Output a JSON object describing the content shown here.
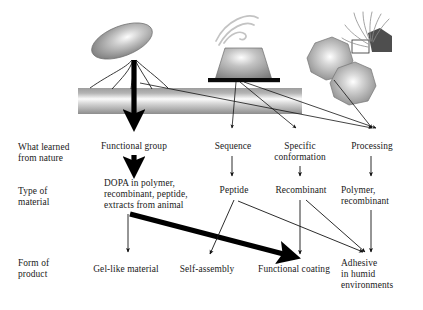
{
  "diagram": {
    "row_labels": [
      {
        "id": "what-learned",
        "text": "What learned\nfrom nature",
        "x": 18,
        "y": 142
      },
      {
        "id": "type-of-material",
        "text": "Type of\nmaterial",
        "x": 18,
        "y": 186
      },
      {
        "id": "form-of-product",
        "text": "Form of\nproduct",
        "x": 18,
        "y": 258
      }
    ],
    "organisms": [
      {
        "id": "mussel",
        "name": "mussel-on-substrate-illustration"
      },
      {
        "id": "barnacle",
        "name": "barnacle-on-substrate-illustration"
      },
      {
        "id": "sandcastle-worm",
        "name": "sandcastle-worm-tube-illustration"
      }
    ],
    "row1": [
      {
        "id": "functional-group",
        "text": "Functional group",
        "x": 124,
        "y": 141,
        "w": 90
      },
      {
        "id": "sequence",
        "text": "Sequence",
        "x": 222,
        "y": 141,
        "w": 56
      },
      {
        "id": "specific-conformation",
        "text": "Specific\nconformation",
        "x": 278,
        "y": 141,
        "w": 66
      },
      {
        "id": "processing",
        "text": "Processing",
        "x": 348,
        "y": 141,
        "w": 60
      }
    ],
    "row2": [
      {
        "id": "dopa-materials",
        "text": "DOPA in polymer,\nrecombinant, peptide,\nextracts from animal",
        "x": 106,
        "y": 179,
        "w": 118
      },
      {
        "id": "peptide",
        "text": "Peptide",
        "x": 224,
        "y": 185,
        "w": 46
      },
      {
        "id": "recombinant",
        "text": "Recombinant",
        "x": 276,
        "y": 185,
        "w": 72
      },
      {
        "id": "polymer-recombinant",
        "text": "Polymer,\nrecombinant",
        "x": 350,
        "y": 185,
        "w": 66
      }
    ],
    "row3": [
      {
        "id": "gel-like-material",
        "text": "Gel-like material",
        "x": 84,
        "y": 265,
        "w": 86
      },
      {
        "id": "self-assembly",
        "text": "Self-assembly",
        "x": 172,
        "y": 265,
        "w": 74
      },
      {
        "id": "functional-coating",
        "text": "Functional coating",
        "x": 250,
        "y": 265,
        "w": 96
      },
      {
        "id": "adhesive-humid",
        "text": "Adhesive\nin humid\nenvironments",
        "x": 350,
        "y": 259,
        "w": 70
      }
    ],
    "colors": {
      "arrow_thick": "#000000",
      "arrow_thin": "#1c1c1c",
      "text": "#1a1a1a",
      "substrate_light": "#f2f2f2",
      "substrate_mid": "#9a9a9a",
      "organism_fill": "#8c8c8c",
      "background": "#ffffff"
    }
  }
}
